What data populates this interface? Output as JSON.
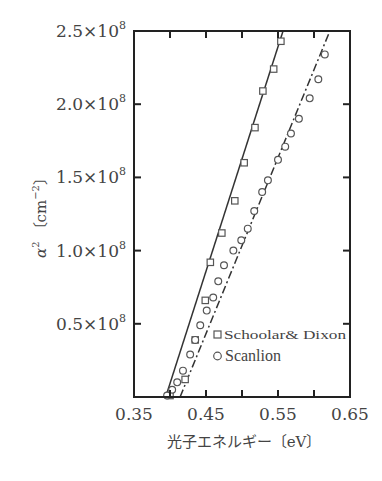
{
  "chart_data": {
    "type": "scatter",
    "title": "",
    "xlabel": "光子エネルギー〔eV〕",
    "ylabel": "α² 〔cm⁻²〕",
    "xlim": [
      0.35,
      0.65
    ],
    "ylim": [
      0,
      250000000.0
    ],
    "grid": false,
    "legend_position": "lower right (inside)",
    "x_ticks": [
      0.35,
      0.4,
      0.45,
      0.5,
      0.55,
      0.6,
      0.65
    ],
    "x_tick_labels": [
      "0.35",
      "0.45",
      "0.55",
      "0.65"
    ],
    "y_ticks": [
      50000000.0,
      100000000.0,
      150000000.0,
      200000000.0,
      250000000.0
    ],
    "y_tick_labels": [
      {
        "mantissa": "0.5",
        "base": "×10",
        "exp": "8"
      },
      {
        "mantissa": "1.0",
        "base": "×10",
        "exp": "8"
      },
      {
        "mantissa": "1.5",
        "base": "×10",
        "exp": "8"
      },
      {
        "mantissa": "2.0",
        "base": "×10",
        "exp": "8"
      },
      {
        "mantissa": "2.5",
        "base": "×10",
        "exp": "8"
      }
    ],
    "series": [
      {
        "name": "Schoolar & Dixon",
        "marker": "square",
        "fit_line": {
          "style": "solid",
          "x": [
            0.394,
            0.557
          ],
          "y": [
            0,
            250000000.0
          ]
        },
        "x": [
          0.4,
          0.421,
          0.435,
          0.449,
          0.456,
          0.472,
          0.49,
          0.503,
          0.518,
          0.529,
          0.544,
          0.554
        ],
        "y": [
          1000000.0,
          12000000.0,
          39000000.0,
          66000000.0,
          92000000.0,
          112000000.0,
          134000000.0,
          160000000.0,
          184000000.0,
          209000000.0,
          224000000.0,
          243000000.0
        ]
      },
      {
        "name": "Scanlion",
        "marker": "circle",
        "fit_line": {
          "style": "dash-dot",
          "x": [
            0.414,
            0.622
          ],
          "y": [
            0,
            250000000.0
          ]
        },
        "x": [
          0.396,
          0.403,
          0.41,
          0.418,
          0.428,
          0.435,
          0.442,
          0.451,
          0.46,
          0.467,
          0.475,
          0.488,
          0.499,
          0.508,
          0.517,
          0.528,
          0.536,
          0.55,
          0.56,
          0.568,
          0.579,
          0.594,
          0.606,
          0.615
        ],
        "y": [
          1000000.0,
          5000000.0,
          10000000.0,
          18000000.0,
          29000000.0,
          39000000.0,
          49000000.0,
          59000000.0,
          68000000.0,
          79000000.0,
          90000000.0,
          100000000.0,
          107000000.0,
          115000000.0,
          127000000.0,
          140000000.0,
          148000000.0,
          162000000.0,
          171000000.0,
          180000000.0,
          190000000.0,
          204000000.0,
          217000000.0,
          234000000.0
        ]
      }
    ]
  },
  "axes": {
    "xlabel": "光子エネルギー〔eV〕",
    "ylabel_main": "α",
    "ylabel_sup": "2",
    "ylabel_unit": "〔cm",
    "ylabel_unit_sup": "−2",
    "ylabel_unit_close": "〕"
  },
  "legend": {
    "items": [
      {
        "symbol": "□",
        "label": "Schoolar& Dixon"
      },
      {
        "symbol": "○",
        "label": "Scanlion"
      }
    ]
  },
  "colors": {
    "axis": "#222222",
    "marker": "#555555",
    "line": "#333333",
    "text": "#444444"
  }
}
